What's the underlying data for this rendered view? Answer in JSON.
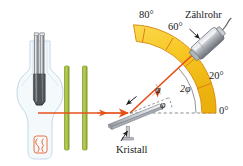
{
  "figure": {
    "language": "de"
  },
  "labels": {
    "deg_80": "80°",
    "deg_60": "60°",
    "deg_20": "20°",
    "deg_0": "0°",
    "counter_tube": "Zählrohr",
    "crystal": "Kristall",
    "phi_incident": "φ",
    "phi_reflected": "φ",
    "two_phi": "2φ"
  },
  "colors": {
    "beam": "#E8501A",
    "arc_fill": "#F7C623",
    "arc_stroke": "#D98A12",
    "slit_fill": "#A8C13C",
    "slit_stroke": "#7E9A28",
    "metal_light": "#EDEEF0",
    "metal_mid": "#B9BCC1",
    "metal_dark": "#6E7378",
    "glass": "#CFE0EC",
    "filament": "#E8602A",
    "text": "#1A1A1A",
    "dashed": "#7A7A7A"
  },
  "geometry": {
    "crystal_center_x": 130,
    "crystal_center_y": 113,
    "arc_inner_radius": 72,
    "arc_outer_radius": 86,
    "arc_ticks_deg": [
      0,
      20,
      40,
      60,
      80
    ],
    "detector_angle_deg": 43,
    "beam_angle_deg": 43
  },
  "icons": {
    "xray_tube": "xray-tube-icon",
    "collimator_slit": "collimator-slit-icon",
    "crystal_plate": "crystal-plate-icon",
    "detector_tube": "detector-tube-icon",
    "goniometer_arc": "goniometer-arc-icon"
  }
}
